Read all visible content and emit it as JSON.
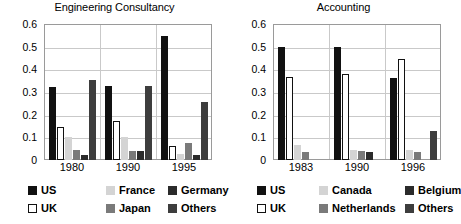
{
  "colors": {
    "us": "#111111",
    "uk": "#ffffff",
    "uk_border": "#111111",
    "france": "#d4d4d4",
    "japan": "#7a7a7a",
    "germany": "#2b2b2b",
    "others": "#3d3d3d",
    "canada": "#d4d4d4",
    "netherlands": "#7a7a7a",
    "belgium": "#2b2b2b",
    "axis": "#9a9a9a",
    "grid": "#c9c9c9"
  },
  "charts": [
    {
      "title": "Engineering Consultancy",
      "yticks": [
        "0.6",
        "0.5",
        "0.4",
        "0.3",
        "0.2",
        "0.1",
        "0"
      ],
      "categories": [
        "1980",
        "1990",
        "1995"
      ],
      "legend": [
        [
          {
            "label": "US",
            "key": "us"
          },
          {
            "label": "France",
            "key": "france"
          },
          {
            "label": "Germany",
            "key": "germany"
          }
        ],
        [
          {
            "label": "UK",
            "key": "uk"
          },
          {
            "label": "Japan",
            "key": "japan"
          },
          {
            "label": "Others",
            "key": "others"
          }
        ]
      ]
    },
    {
      "title": "Accounting",
      "yticks": [
        "0.6",
        "0.5",
        "0.4",
        "0.3",
        "0.2",
        "0.1",
        "0"
      ],
      "categories": [
        "1983",
        "1990",
        "1996"
      ],
      "legend": [
        [
          {
            "label": "US",
            "key": "us"
          },
          {
            "label": "Canada",
            "key": "canada"
          },
          {
            "label": "Belgium",
            "key": "belgium"
          }
        ],
        [
          {
            "label": "UK",
            "key": "uk"
          },
          {
            "label": "Netherlands",
            "key": "netherlands"
          },
          {
            "label": "Others",
            "key": "others"
          }
        ]
      ]
    }
  ],
  "chart_data": [
    {
      "type": "bar",
      "title": "Engineering Consultancy",
      "xlabel": "",
      "ylabel": "",
      "ylim": [
        0,
        0.6
      ],
      "ytick_values": [
        0,
        0.1,
        0.2,
        0.3,
        0.4,
        0.5,
        0.6
      ],
      "grid": true,
      "legend_position": "below",
      "categories": [
        "1980",
        "1990",
        "1995"
      ],
      "series": [
        {
          "name": "US",
          "color_key": "us",
          "values": [
            0.32,
            0.325,
            0.545
          ]
        },
        {
          "name": "UK",
          "color_key": "uk",
          "values": [
            0.145,
            0.17,
            0.06
          ]
        },
        {
          "name": "France",
          "color_key": "france",
          "values": [
            0.1,
            0.1,
            0.025
          ]
        },
        {
          "name": "Japan",
          "color_key": "japan",
          "values": [
            0.045,
            0.04,
            0.075
          ]
        },
        {
          "name": "Germany",
          "color_key": "germany",
          "values": [
            0.02,
            0.04,
            0.02
          ]
        },
        {
          "name": "Others",
          "color_key": "others",
          "values": [
            0.355,
            0.325,
            0.255
          ]
        }
      ]
    },
    {
      "type": "bar",
      "title": "Accounting",
      "xlabel": "",
      "ylabel": "",
      "ylim": [
        0,
        0.6
      ],
      "ytick_values": [
        0,
        0.1,
        0.2,
        0.3,
        0.4,
        0.5,
        0.6
      ],
      "grid": true,
      "legend_position": "below",
      "categories": [
        "1983",
        "1990",
        "1996"
      ],
      "series": [
        {
          "name": "US",
          "color_key": "us",
          "values": [
            0.5,
            0.5,
            0.36
          ]
        },
        {
          "name": "UK",
          "color_key": "uk",
          "values": [
            0.365,
            0.38,
            0.445
          ]
        },
        {
          "name": "Canada",
          "color_key": "canada",
          "values": [
            0.065,
            0.045,
            0.045
          ]
        },
        {
          "name": "Netherlands",
          "color_key": "netherlands",
          "values": [
            0.035,
            0.04,
            0.035
          ]
        },
        {
          "name": "Belgium",
          "color_key": "belgium",
          "values": [
            0.0,
            0.035,
            0.0
          ]
        },
        {
          "name": "Others",
          "color_key": "others",
          "values": [
            0.0,
            0.0,
            0.13
          ]
        }
      ]
    }
  ]
}
